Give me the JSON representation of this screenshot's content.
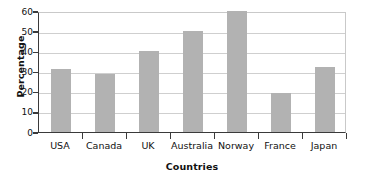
{
  "chart_data": {
    "type": "bar",
    "title": "",
    "xlabel": "Countries",
    "ylabel": "Percentage",
    "categories": [
      "USA",
      "Canada",
      "UK",
      "Australia",
      "Norway",
      "France",
      "Japan"
    ],
    "values": [
      31,
      29,
      40,
      50,
      60,
      19.5,
      32
    ],
    "ylim": [
      0,
      60
    ],
    "yticks": [
      0,
      10,
      20,
      30,
      40,
      50,
      60
    ],
    "ytick_labels": [
      "0",
      "10",
      "20",
      "30",
      "40",
      "50",
      "60"
    ],
    "grid": true,
    "grid_axis": "y",
    "legend": false,
    "legend_position": "none",
    "bar_color": "#b2b2b2",
    "axis_color": "#3a3a3a",
    "gridline_color": "#cfcfcf",
    "frame_color": "#c9c9c9",
    "text_color": "#111111",
    "background": "#ffffff"
  }
}
